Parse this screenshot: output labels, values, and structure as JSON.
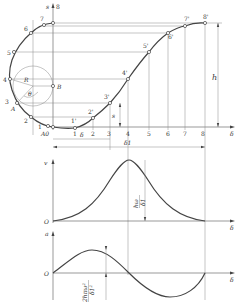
{
  "figure": {
    "displacement": {
      "axis_label_s": "s",
      "axis_label_delta": "δ",
      "circle_labels": {
        "radius": "R",
        "angle": "θ",
        "point_B": "B",
        "point_A": "A",
        "origin": "A0"
      },
      "circle_points": [
        "1",
        "2",
        "3",
        "4",
        "5",
        "6",
        "7",
        "8"
      ],
      "curve_points": [
        "1'",
        "2'",
        "3'",
        "4'",
        "5'",
        "6'",
        "7'",
        "8'"
      ],
      "delta_ticks": [
        "1",
        "2",
        "3",
        "4",
        "5",
        "6",
        "7",
        "8"
      ],
      "dim_h": "h",
      "dim_s": "s",
      "dim_delta": "δ",
      "dim_delta1": "δ1"
    },
    "velocity": {
      "axis_label": "v",
      "origin": "O",
      "delta": "δ",
      "peak_label_num": "hω",
      "peak_label_den": "δ1"
    },
    "acceleration": {
      "axis_label": "a",
      "origin": "O",
      "delta": "δ",
      "peak_label_num": "2hπω²",
      "peak_label_den": "δ1²"
    }
  }
}
